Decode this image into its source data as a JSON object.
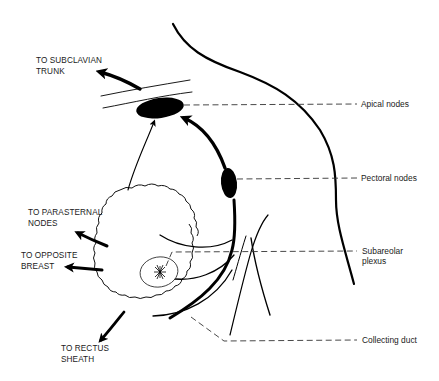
{
  "diagram": {
    "left_labels": {
      "subclavian": [
        "TO SUBCLAVIAN",
        "TRUNK"
      ],
      "parasternal": [
        "TO PARASTERNAL",
        "NODES"
      ],
      "opposite_breast": [
        "TO OPPOSITE",
        "BREAST"
      ],
      "rectus_sheath": [
        "TO RECTUS",
        "SHEATH"
      ]
    },
    "right_labels": {
      "apical_nodes": [
        "Apical nodes"
      ],
      "pectoral_nodes": [
        "Pectoral nodes"
      ],
      "subareolar_plexus": [
        "Subareolar",
        "plexus"
      ],
      "collecting_duct": [
        "Collecting duct"
      ]
    },
    "colors": {
      "ink": "#000000",
      "background": "#ffffff",
      "leader": "#333333"
    }
  }
}
